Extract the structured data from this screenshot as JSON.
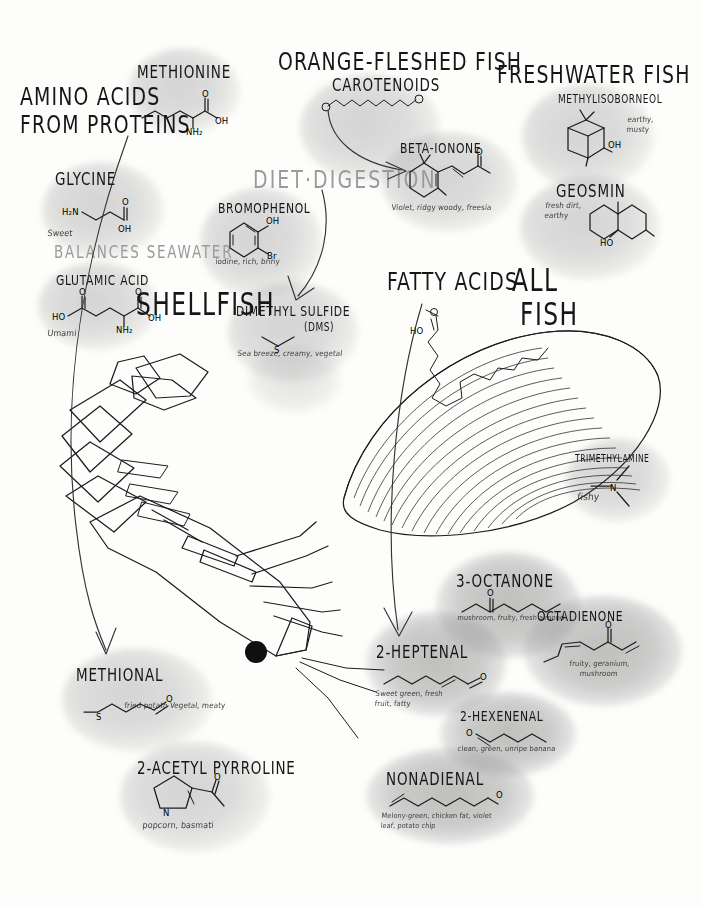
{
  "poster": {
    "title": "Seafood Aroma Compounds",
    "background_color": "#fdfdfc",
    "ink_color": "#1c1c1c",
    "blob_color": "#8a8a8a"
  },
  "sections": {
    "amino_acids": {
      "heading_line1": "AMINO ACIDS",
      "heading_line2": "FROM PROTEINS",
      "subheading": "BALANCES SEAWATER",
      "shellfish_label": "SHELLFISH"
    },
    "diet_digestion": {
      "heading": "DIET·DIGESTION"
    },
    "orange_fleshed": {
      "heading": "ORANGE-FLESHED FISH",
      "subheading": "CAROTENOIDS"
    },
    "freshwater": {
      "heading": "FRESHWATER FISH"
    },
    "fatty_acids": {
      "heading": "FATTY ACIDS",
      "heading2_line1": "ALL",
      "heading2_line2": "FISH"
    }
  },
  "compounds": [
    {
      "id": "methionine",
      "name": "METHIONINE",
      "descriptor": "",
      "atoms": [
        "O",
        "OH",
        "NH₂",
        "S"
      ]
    },
    {
      "id": "glycine",
      "name": "GLYCINE",
      "descriptor": "Sweet",
      "atoms": [
        "H₂N",
        "O",
        "OH"
      ]
    },
    {
      "id": "glutamic-acid",
      "name": "GLUTAMIC ACID",
      "descriptor": "Umami",
      "atoms": [
        "O",
        "O",
        "HO",
        "OH",
        "NH₂"
      ]
    },
    {
      "id": "carotenoids",
      "name": "CAROTENOIDS",
      "descriptor": "",
      "atoms": []
    },
    {
      "id": "beta-ionone",
      "name": "BETA-IONONE",
      "descriptor": "Violet, ridgy woody, freesia",
      "atoms": [
        "O"
      ]
    },
    {
      "id": "methylisoborneol",
      "name": "METHYLISOBORNEOL",
      "descriptor": "earthy, musty",
      "atoms": [
        "OH"
      ]
    },
    {
      "id": "geosmin",
      "name": "GEOSMIN",
      "descriptor": "fresh dirt, earthy",
      "atoms": [
        "HO"
      ]
    },
    {
      "id": "bromophenol",
      "name": "BROMOPHENOL",
      "descriptor": "iodine, rich, briny",
      "atoms": [
        "OH",
        "Br"
      ]
    },
    {
      "id": "dimethyl-sulfide",
      "name": "DIMETHYL SULFIDE",
      "name_suffix": "(DMS)",
      "descriptor": "Sea breeze, creamy, vegetal",
      "atoms": [
        "S"
      ]
    },
    {
      "id": "trimethylamine",
      "name": "TRIMETHYLAMINE",
      "descriptor": "fishy",
      "atoms": [
        "N"
      ]
    },
    {
      "id": "methional",
      "name": "METHIONAL",
      "descriptor": "fried potato Vegetal, meaty",
      "atoms": [
        "O",
        "S"
      ]
    },
    {
      "id": "acetyl-pyrroline",
      "name": "2-ACETYL PYRROLINE",
      "descriptor": "popcorn, basmati",
      "atoms": [
        "N",
        "O"
      ]
    },
    {
      "id": "heptenal",
      "name": "2-HEPTENAL",
      "descriptor": "Sweet green, fresh fruit, fatty",
      "atoms": [
        "O"
      ]
    },
    {
      "id": "octanone",
      "name": "3-OCTANONE",
      "descriptor": "mushroom, fruity, fresh almond",
      "atoms": [
        "O"
      ]
    },
    {
      "id": "octadienone",
      "name": "OCTADIENONE",
      "descriptor": "fruity, geranium, mushroom",
      "atoms": [
        "O"
      ]
    },
    {
      "id": "hexenenal",
      "name": "2-HEXENENAL",
      "descriptor": "clean, green, unripe banana",
      "atoms": [
        "O"
      ]
    },
    {
      "id": "nonadienal",
      "name": "NONADIENAL",
      "descriptor": "Melony-green, chicken fat, violet leaf, potato chip",
      "atoms": [
        "O"
      ]
    }
  ],
  "illustrations": [
    {
      "id": "shrimp",
      "label": "shrimp-illustration"
    },
    {
      "id": "fish-fillet",
      "label": "fish-fillet-illustration"
    }
  ],
  "connectors": [
    {
      "id": "amino-to-methional",
      "from": "amino_acids",
      "to": "methional"
    },
    {
      "id": "carotenoid-to-ionone",
      "from": "carotenoids",
      "to": "beta-ionone"
    },
    {
      "id": "diet-to-dms",
      "from": "diet_digestion",
      "to": "dimethyl-sulfide"
    },
    {
      "id": "fatty-to-heptenal",
      "from": "fatty_acids",
      "to": "heptenal"
    }
  ]
}
